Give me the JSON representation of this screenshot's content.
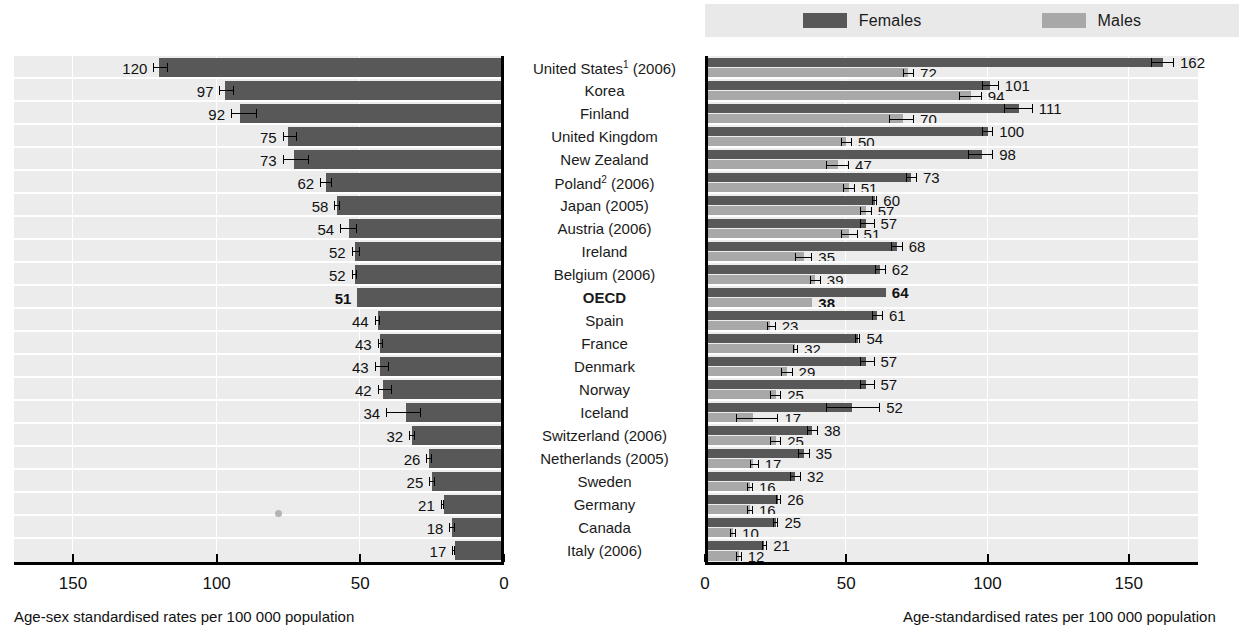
{
  "legend": {
    "items": [
      {
        "label": "Females",
        "color": "#585858",
        "icon": "legend-swatch"
      },
      {
        "label": "Males",
        "color": "#a8a8a8",
        "icon": "legend-swatch"
      }
    ]
  },
  "axes": {
    "left": {
      "caption": "Age-sex standardised rates per 100 000 population",
      "ticks": [
        "150",
        "100",
        "50",
        "0"
      ],
      "range": [
        0,
        170
      ],
      "reversed": true
    },
    "right": {
      "caption": "Age-standardised rates per 100 000 population",
      "ticks": [
        "0",
        "50",
        "100",
        "150"
      ],
      "range": [
        0,
        175
      ],
      "reversed": false
    }
  },
  "chart_data": {
    "type": "bar",
    "title": "",
    "subtitle": "",
    "xlabel_left": "Age-sex standardised rates per 100 000 population",
    "xlabel_right": "Age-standardised rates per 100 000 population",
    "ylabel": "",
    "grid": true,
    "legend_position": "top-right",
    "xlim_left": [
      0,
      170
    ],
    "xlim_right": [
      0,
      175
    ],
    "categories": [
      "United States¹ (2006)",
      "Korea",
      "Finland",
      "United Kingdom",
      "New Zealand",
      "Poland² (2006)",
      "Japan (2005)",
      "Austria (2006)",
      "Ireland",
      "Belgium (2006)",
      "OECD",
      "Spain",
      "France",
      "Denmark",
      "Norway",
      "Iceland",
      "Switzerland (2006)",
      "Netherlands (2005)",
      "Sweden",
      "Germany",
      "Canada",
      "Italy (2006)"
    ],
    "series": [
      {
        "name": "Total (age-sex standardised)",
        "panel": "left",
        "values": [
          120,
          97,
          92,
          75,
          73,
          62,
          58,
          54,
          52,
          52,
          51,
          44,
          43,
          43,
          42,
          34,
          32,
          26,
          25,
          21,
          18,
          17
        ],
        "ci_low": [
          117,
          94,
          86,
          72,
          68,
          60,
          57,
          51,
          50,
          51,
          51,
          43,
          42,
          40,
          39,
          29,
          31,
          25,
          24,
          21,
          17,
          17
        ],
        "ci_high": [
          122,
          99,
          95,
          77,
          77,
          64,
          59,
          57,
          53,
          53,
          51,
          45,
          44,
          45,
          44,
          41,
          33,
          27,
          26,
          22,
          19,
          18
        ]
      },
      {
        "name": "Females",
        "panel": "right",
        "values": [
          162,
          101,
          111,
          100,
          98,
          73,
          60,
          57,
          68,
          62,
          64,
          61,
          54,
          57,
          57,
          52,
          38,
          35,
          32,
          26,
          25,
          21
        ],
        "ci_low": [
          158,
          98,
          106,
          98,
          93,
          71,
          59,
          55,
          66,
          60,
          64,
          59,
          53,
          55,
          55,
          43,
          36,
          33,
          30,
          25,
          24,
          20
        ],
        "ci_high": [
          166,
          104,
          116,
          102,
          102,
          75,
          61,
          60,
          70,
          64,
          64,
          63,
          55,
          60,
          60,
          62,
          40,
          37,
          34,
          27,
          26,
          22
        ]
      },
      {
        "name": "Males",
        "panel": "right",
        "values": [
          72,
          94,
          70,
          50,
          47,
          51,
          57,
          51,
          35,
          39,
          38,
          23,
          32,
          29,
          25,
          17,
          25,
          17,
          16,
          16,
          10,
          12
        ],
        "ci_low": [
          70,
          90,
          65,
          48,
          43,
          49,
          55,
          48,
          32,
          37,
          38,
          22,
          31,
          27,
          23,
          11,
          23,
          16,
          15,
          15,
          9,
          11
        ],
        "ci_high": [
          74,
          98,
          74,
          52,
          51,
          53,
          59,
          54,
          38,
          41,
          38,
          25,
          33,
          31,
          27,
          26,
          27,
          19,
          17,
          17,
          11,
          13
        ]
      }
    ],
    "highlight_row": "OECD"
  }
}
